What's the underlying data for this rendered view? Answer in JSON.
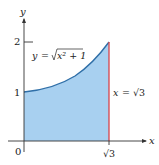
{
  "diagram": {
    "type": "region-under-curve",
    "axes": {
      "x_label": "x",
      "y_label": "y",
      "origin_label": "0",
      "y_ticks": [
        {
          "value": 1,
          "label": "1"
        },
        {
          "value": 2,
          "label": "2"
        }
      ],
      "x_ticks": [
        {
          "value": 1.732,
          "label": "√3"
        }
      ]
    },
    "curve": {
      "equation_label": "y = √(x² + 1)",
      "lhs": "y",
      "eq": "=",
      "rhs_radicand": "x² + 1"
    },
    "boundary": {
      "equation_label": "x = √3",
      "lhs": "x",
      "eq": "=",
      "rhs": "√3"
    },
    "colors": {
      "fill": "#a8d0f0",
      "curve": "#2f6fa8",
      "boundary": "#d6434a",
      "axis": "#333333"
    }
  }
}
